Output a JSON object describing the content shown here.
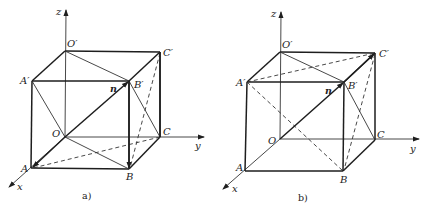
{
  "figure_a": {
    "caption": "a)",
    "axis_labels": {
      "x": "x",
      "y": "y",
      "z": "z"
    },
    "vertices": {
      "O": "O",
      "A": "A",
      "B": "B",
      "C": "C",
      "O1": "O′",
      "A1": "A′",
      "B1": "B′",
      "C1": "C′"
    },
    "vector_label": "n"
  },
  "figure_b": {
    "caption": "b)",
    "axis_labels": {
      "x": "x",
      "y": "y",
      "z": "z"
    },
    "vertices": {
      "O": "O",
      "A": "A",
      "B": "B",
      "C": "C",
      "O1": "O′",
      "A1": "A′",
      "B1": "B′",
      "C1": "C′"
    },
    "vector_label": "n"
  },
  "colors": {
    "ink": "#1e1e1e",
    "background": "#ffffff"
  }
}
